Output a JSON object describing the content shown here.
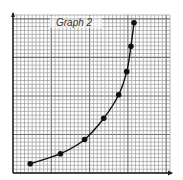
{
  "chart_data": {
    "type": "line",
    "title": "Graph 2",
    "xlabel": "",
    "ylabel": "",
    "grid": true,
    "legend": null,
    "xlim": [
      0,
      41
    ],
    "ylim": [
      0,
      41
    ],
    "minor_divisions": 41,
    "major_every": 10,
    "markers": true,
    "curve": "smooth exponential growth",
    "points": [
      {
        "x": 4.5,
        "y": 2.4
      },
      {
        "x": 12.4,
        "y": 5.0
      },
      {
        "x": 18.7,
        "y": 8.7
      },
      {
        "x": 23.7,
        "y": 14.2
      },
      {
        "x": 27.6,
        "y": 20.3
      },
      {
        "x": 29.7,
        "y": 26.3
      },
      {
        "x": 30.8,
        "y": 32.9
      },
      {
        "x": 31.6,
        "y": 39.0
      }
    ],
    "colors": {
      "grid_minor": "#9a9a9a",
      "grid_major": "#6e6e6e",
      "line": "#111111",
      "marker": "#111111",
      "axis": "#222222"
    }
  }
}
